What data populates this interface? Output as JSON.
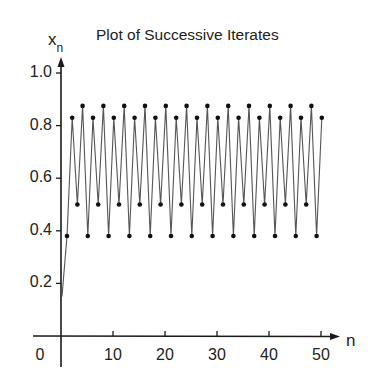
{
  "chart_data": {
    "type": "line",
    "title": "Plot of Successive Iterates",
    "xlabel": "n",
    "ylabel": "x",
    "ylabel_subscript": "n",
    "xlim": [
      0,
      52
    ],
    "ylim": [
      0,
      1.0
    ],
    "grid": false,
    "legend": null,
    "x_ticks": [
      10,
      20,
      30,
      40,
      50
    ],
    "x_tick_labels": [
      "10",
      "20",
      "30",
      "40",
      "50"
    ],
    "origin_label": "0",
    "y_ticks": [
      0.2,
      0.4,
      0.6,
      0.8,
      1.0
    ],
    "y_tick_labels": [
      "0.2",
      "0.4",
      "0.6",
      "0.8",
      "1.0"
    ],
    "series": [
      {
        "name": "x_n",
        "start": {
          "n": 0,
          "value": 0.15
        },
        "markers": true,
        "cycle_note": "period-4 cycle after n=1",
        "x": [
          1,
          2,
          3,
          4,
          5,
          6,
          7,
          8,
          9,
          10,
          11,
          12,
          13,
          14,
          15,
          16,
          17,
          18,
          19,
          20,
          21,
          22,
          23,
          24,
          25,
          26,
          27,
          28,
          29,
          30,
          31,
          32,
          33,
          34,
          35,
          36,
          37,
          38,
          39,
          40,
          41,
          42,
          43,
          44,
          45,
          46,
          47,
          48,
          49,
          50
        ],
        "values": [
          0.38,
          0.83,
          0.5,
          0.875,
          0.38,
          0.83,
          0.5,
          0.875,
          0.38,
          0.83,
          0.5,
          0.875,
          0.38,
          0.83,
          0.5,
          0.875,
          0.38,
          0.83,
          0.5,
          0.875,
          0.38,
          0.83,
          0.5,
          0.875,
          0.38,
          0.83,
          0.5,
          0.875,
          0.38,
          0.83,
          0.5,
          0.875,
          0.38,
          0.83,
          0.5,
          0.875,
          0.38,
          0.83,
          0.5,
          0.875,
          0.38,
          0.83,
          0.5,
          0.875,
          0.38,
          0.83,
          0.5,
          0.875,
          0.38,
          0.83
        ]
      }
    ]
  },
  "colors": {
    "axis": "#1a1a1a",
    "line": "#555555",
    "marker": "#111111"
  }
}
